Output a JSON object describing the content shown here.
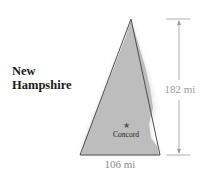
{
  "title_line1": "New",
  "title_line2": "Hampshire",
  "height_label": "182 mi",
  "base_label": "106 mi",
  "city_label": "Concord",
  "colors": {
    "region_fill": "#b9b9b9",
    "triangle_stroke": "#4a4a4a",
    "dimension_line": "#9a9a9a",
    "dimension_text": "#9a9a9a",
    "star": "#555555"
  }
}
